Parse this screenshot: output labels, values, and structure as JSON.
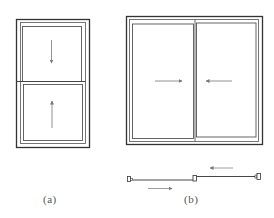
{
  "figure": {
    "colors": {
      "stroke": "#333333",
      "light_stroke": "#6a6a6a",
      "arrow": "#777777",
      "background": "#ffffff"
    },
    "panel_a": {
      "label": "(a)",
      "type": "double-hung window (elevation)",
      "arrows": [
        {
          "sash": "upper",
          "direction": "down"
        },
        {
          "sash": "lower",
          "direction": "up"
        }
      ]
    },
    "panel_b": {
      "label": "(b)",
      "type": "sliding window (elevation and plan)",
      "arrows": [
        {
          "sash": "left",
          "direction": "right"
        },
        {
          "sash": "right",
          "direction": "left"
        },
        {
          "location": "plan-upper",
          "direction": "left"
        },
        {
          "location": "plan-lower",
          "direction": "right"
        }
      ]
    }
  }
}
